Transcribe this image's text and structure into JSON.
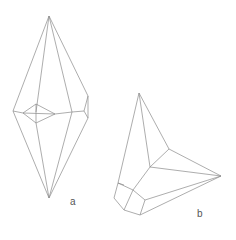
{
  "figure": {
    "labels": {
      "a": "a",
      "b": "b"
    },
    "colors": {
      "edge": "#8a8a8a",
      "label": "#555555",
      "background": "#ffffff"
    },
    "crystal_a": {
      "description": "Elongated bipyramidal crystal form",
      "edges": [
        [
          49,
          16,
          13,
          111
        ],
        [
          49,
          16,
          36,
          112
        ],
        [
          49,
          16,
          72,
          112
        ],
        [
          49,
          16,
          88,
          96
        ],
        [
          49,
          198,
          13,
          111
        ],
        [
          49,
          198,
          36,
          123
        ],
        [
          49,
          198,
          72,
          112
        ],
        [
          49,
          198,
          88,
          118
        ],
        [
          13,
          111,
          23,
          113
        ],
        [
          23,
          113,
          36,
          104
        ],
        [
          36,
          104,
          55,
          114
        ],
        [
          55,
          114,
          36,
          123
        ],
        [
          36,
          123,
          23,
          113
        ],
        [
          23,
          113,
          55,
          114
        ],
        [
          36,
          104,
          36,
          123
        ],
        [
          55,
          114,
          72,
          112
        ],
        [
          72,
          112,
          84,
          111
        ],
        [
          84,
          111,
          88,
          96
        ],
        [
          84,
          111,
          88,
          118
        ],
        [
          88,
          96,
          88,
          118
        ]
      ]
    },
    "crystal_b": {
      "description": "Tilted pyramidal crystal form with truncated base",
      "edges": [
        [
          139,
          93,
          118,
          183
        ],
        [
          139,
          93,
          150,
          167
        ],
        [
          139,
          93,
          169,
          149
        ],
        [
          169,
          149,
          221,
          176
        ],
        [
          169,
          149,
          150,
          167
        ],
        [
          150,
          167,
          221,
          176
        ],
        [
          118,
          183,
          114,
          198
        ],
        [
          114,
          198,
          124,
          210
        ],
        [
          124,
          210,
          140,
          215
        ],
        [
          118,
          183,
          133,
          190
        ],
        [
          133,
          190,
          150,
          167
        ],
        [
          133,
          190,
          124,
          210
        ],
        [
          133,
          190,
          145,
          200
        ],
        [
          145,
          200,
          140,
          215
        ],
        [
          145,
          200,
          221,
          176
        ],
        [
          140,
          215,
          221,
          176
        ],
        [
          118,
          183,
          124,
          185
        ]
      ]
    }
  }
}
